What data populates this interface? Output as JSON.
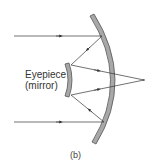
{
  "diagram": {
    "labels": {
      "eyepiece_line1": "Eyepiece",
      "eyepiece_line2": "(mirror)",
      "caption": "(b)"
    },
    "colors": {
      "mirror_fill": "#a8a8a8",
      "mirror_stroke": "#555555",
      "ray": "#333333",
      "background": "#ffffff"
    },
    "components": [
      "primary-mirror",
      "secondary-mirror",
      "incoming-ray-top",
      "incoming-ray-bottom",
      "reflected-rays",
      "focal-point"
    ]
  }
}
